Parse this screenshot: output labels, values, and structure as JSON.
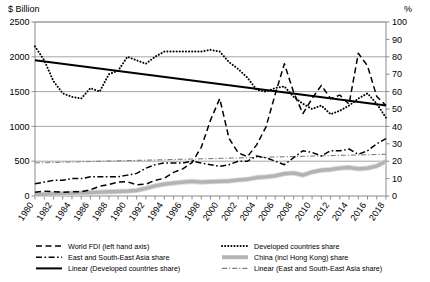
{
  "chart_data": {
    "type": "line",
    "title": "",
    "ylabel": "$ Billion",
    "y2label": "%",
    "xlabel": "",
    "ylim": [
      0,
      2500
    ],
    "y2lim": [
      0,
      100
    ],
    "grid": true,
    "legend_position": "bottom",
    "yticks": [
      0,
      500,
      1000,
      1500,
      2000,
      2500
    ],
    "y2ticks": [
      0,
      10,
      20,
      30,
      40,
      50,
      60,
      70,
      80,
      90,
      100
    ],
    "x": [
      1980,
      1981,
      1982,
      1983,
      1984,
      1985,
      1986,
      1987,
      1988,
      1989,
      1990,
      1991,
      1992,
      1993,
      1994,
      1995,
      1996,
      1997,
      1998,
      1999,
      2000,
      2001,
      2002,
      2003,
      2004,
      2005,
      2006,
      2007,
      2008,
      2009,
      2010,
      2011,
      2012,
      2013,
      2014,
      2015,
      2016,
      2017,
      2018
    ],
    "xtick_labels": [
      "1980",
      "1982",
      "1984",
      "1986",
      "1988",
      "1990",
      "1992",
      "1994",
      "1996",
      "1998",
      "2000",
      "2002",
      "2004",
      "2006",
      "2008",
      "2010",
      "2012",
      "2014",
      "2016",
      "2018"
    ],
    "series": [
      {
        "name": "World FDI (left hand axis)",
        "axis": "left",
        "style": "dashed",
        "color": "#000000",
        "values": [
          55,
          70,
          60,
          55,
          60,
          60,
          90,
          140,
          165,
          200,
          205,
          160,
          170,
          225,
          255,
          340,
          390,
          480,
          700,
          1090,
          1400,
          830,
          620,
          565,
          735,
          990,
          1460,
          1900,
          1490,
          1185,
          1400,
          1590,
          1400,
          1450,
          1320,
          2050,
          1870,
          1430,
          1300
        ]
      },
      {
        "name": "Developed countries share",
        "axis": "right",
        "style": "dotted",
        "color": "#000000",
        "values": [
          86,
          78,
          66,
          59,
          57,
          56,
          62,
          60,
          70,
          72,
          80,
          78,
          76,
          80,
          83,
          83,
          83,
          83,
          83,
          84,
          83,
          77,
          73,
          68,
          61,
          60,
          62,
          63,
          57,
          53,
          50,
          52,
          47,
          49,
          52,
          56,
          59,
          53,
          45
        ]
      },
      {
        "name": "East and South-East Asia share",
        "axis": "right",
        "style": "dashdot",
        "color": "#000000",
        "values": [
          7,
          8,
          9,
          9,
          10,
          10,
          11,
          11,
          11,
          11,
          12,
          13,
          16,
          18,
          19,
          19,
          19,
          20,
          19,
          18,
          17,
          18,
          20,
          20,
          23,
          22,
          20,
          18,
          22,
          26,
          25,
          23,
          26,
          26,
          27,
          24,
          26,
          30,
          33
        ]
      },
      {
        "name": "China (incl Hong Kong) share",
        "axis": "left",
        "style": "thick-grey",
        "color": "#b3b3b3",
        "values": [
          20,
          25,
          30,
          35,
          40,
          45,
          50,
          55,
          60,
          65,
          70,
          80,
          110,
          145,
          170,
          185,
          200,
          210,
          200,
          205,
          210,
          215,
          230,
          240,
          265,
          275,
          290,
          320,
          330,
          300,
          345,
          370,
          380,
          400,
          410,
          390,
          400,
          430,
          500
        ]
      },
      {
        "name": "Linear (Developed countries share)",
        "axis": "right",
        "style": "solid-thick",
        "color": "#000000",
        "trend": [
          78,
          52
        ]
      },
      {
        "name": "Linear (East and South-East Asia share)",
        "axis": "right",
        "style": "dashdot-thin",
        "color": "#808080",
        "trend": [
          19,
          24
        ]
      }
    ]
  },
  "legend": {
    "items": [
      {
        "label": "World FDI (left hand axis)",
        "marker": "dashed"
      },
      {
        "label": "Developed countries share",
        "marker": "dotted"
      },
      {
        "label": "East and South-East Asia share",
        "marker": "dashdot"
      },
      {
        "label": "China (incl Hong Kong) share",
        "marker": "thick-grey"
      },
      {
        "label": "Linear (Developed countries share)",
        "marker": "solid-thick"
      },
      {
        "label": "Linear (East and South-East Asia share)",
        "marker": "dashdot-thin"
      }
    ]
  }
}
